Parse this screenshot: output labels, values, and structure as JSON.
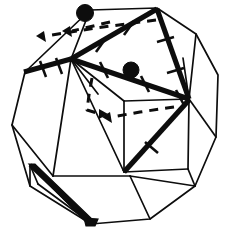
{
  "figure": {
    "kind": "geometric-line-drawing",
    "caption": "",
    "colors": {
      "ink": "#0d0d0d",
      "paper": "#ffffff"
    },
    "canvas": {
      "width": 235,
      "height": 239
    },
    "counts": {
      "marked_vertices": 2,
      "bold_edges": 6,
      "dashed_arrows": 4,
      "tick_marked_edges": 5
    },
    "outer_outline": {
      "name": "decagonal-silhouette",
      "points": "80,49 90,10 157,8 196,34 218,75 216,137 195,186 150,219 91,224 30,186 12,125 25,72"
    },
    "polygons": [
      {
        "name": "upper-left-facet",
        "points": "24,71 90,10 71,58"
      },
      {
        "name": "left-pentagon-facet",
        "points": "24,72 71,58 71,59 53,176 13,124"
      },
      {
        "name": "top-quad-facet",
        "points": "90,10 157,9 71,58"
      },
      {
        "name": "upper-right-facet",
        "points": "157,9 196,34 189,98"
      },
      {
        "name": "right-facet",
        "points": "196,34 218,75 216,137 189,99"
      },
      {
        "name": "lower-right-facet",
        "points": "189,99 216,137 195,186 130,176"
      },
      {
        "name": "bottom-facet",
        "points": "53,176 130,176 150,219 91,224"
      },
      {
        "name": "inner-square-facet",
        "points": "124,101 189,99 188,169 130,176"
      }
    ],
    "bold_edges": [
      {
        "name": "bold-edge-upper-left",
        "from": "24,72",
        "to": "71,59"
      },
      {
        "name": "bold-edge-top-right-diagonal",
        "from": "71,59",
        "to": "157,9"
      },
      {
        "name": "bold-edge-right-descending",
        "from": "157,9",
        "to": "189,99"
      },
      {
        "name": "bold-edge-central-diagonal",
        "from": "71,59",
        "to": "189,99"
      },
      {
        "name": "bold-edge-inner-diagonal",
        "from": "124,172",
        "to": "189,100"
      },
      {
        "name": "bold-edge-bottom-left-wedge",
        "from": "30,165",
        "to": "92,224"
      }
    ],
    "tick_marked_edges": [
      "bold-edge-upper-left",
      "bold-edge-top-right-diagonal",
      "bold-edge-right-descending",
      "bold-edge-central-diagonal",
      "bold-edge-inner-diagonal"
    ],
    "marked_vertices": [
      {
        "name": "vertex-dot-top",
        "cx": 85,
        "cy": 13,
        "r": 8
      },
      {
        "name": "vertex-dot-middle",
        "cx": 131,
        "cy": 70,
        "r": 8
      }
    ],
    "dashed_arrows": [
      {
        "name": "dashed-arrow-top-long",
        "path": "M 156,20 L 96,28 L 43,36"
      },
      {
        "name": "dashed-arrow-top-short",
        "path": "M 108,23 L 68,32"
      },
      {
        "name": "dashed-arrow-center-curve",
        "path": "M 92,78 L 89,94 L 86,110 L 99,114"
      },
      {
        "name": "dashed-arrow-inner-right",
        "path": "M 172,108 L 140,112 L 109,117"
      }
    ]
  }
}
